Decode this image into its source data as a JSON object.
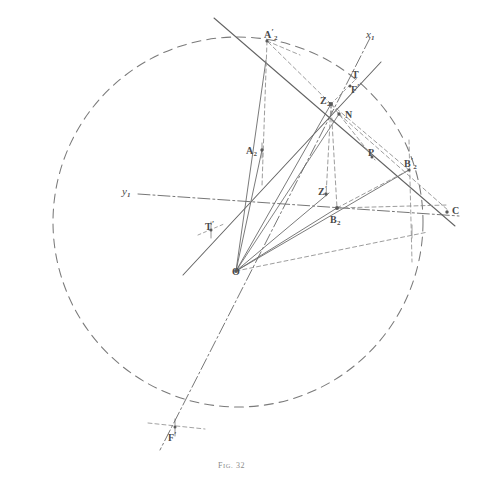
{
  "figure": {
    "caption_prefix": "F",
    "caption_small": "IG.",
    "caption_number": "32",
    "caption_full": "Fig. 32",
    "stroke_color": "#6b6b6b",
    "label_color": "#4a4a4a",
    "background": "#ffffff"
  },
  "labels": [
    {
      "id": "A2prime",
      "text": "A",
      "prime": "′",
      "sub": "2",
      "x": 264,
      "y": 29,
      "italic": false
    },
    {
      "id": "x1",
      "text": "x",
      "prime": "",
      "sub": "1",
      "x": 366,
      "y": 29,
      "italic": true
    },
    {
      "id": "T",
      "text": "T",
      "prime": "",
      "sub": "",
      "x": 352,
      "y": 70,
      "italic": false
    },
    {
      "id": "Fprime",
      "text": "F",
      "prime": "′",
      "sub": "",
      "x": 351,
      "y": 84,
      "italic": false
    },
    {
      "id": "Z2",
      "text": "Z",
      "prime": "",
      "sub": "2",
      "x": 320,
      "y": 96,
      "italic": false
    },
    {
      "id": "N",
      "text": "N",
      "prime": "",
      "sub": "",
      "x": 345,
      "y": 110,
      "italic": false
    },
    {
      "id": "A2",
      "text": "A",
      "prime": "",
      "sub": "2",
      "x": 246,
      "y": 146,
      "italic": false
    },
    {
      "id": "P",
      "text": "P",
      "prime": "",
      "sub": "",
      "x": 368,
      "y": 148,
      "italic": false
    },
    {
      "id": "B2prime",
      "text": "B",
      "prime": "′",
      "sub": "2",
      "x": 404,
      "y": 158,
      "italic": false
    },
    {
      "id": "y1",
      "text": "y",
      "prime": "",
      "sub": "1",
      "x": 122,
      "y": 186,
      "italic": true
    },
    {
      "id": "Zprime",
      "text": "Z",
      "prime": "′",
      "sub": "",
      "x": 318,
      "y": 186,
      "italic": false
    },
    {
      "id": "C",
      "text": "C",
      "prime": "",
      "sub": "",
      "x": 452,
      "y": 206,
      "italic": false
    },
    {
      "id": "Tprime",
      "text": "T",
      "prime": "′",
      "sub": "",
      "x": 205,
      "y": 221,
      "italic": false
    },
    {
      "id": "B2",
      "text": "B",
      "prime": "",
      "sub": "2",
      "x": 330,
      "y": 215,
      "italic": false
    },
    {
      "id": "O",
      "text": "O",
      "prime": "",
      "sub": "",
      "x": 232,
      "y": 267,
      "italic": false
    },
    {
      "id": "Fprime2",
      "text": "F",
      "prime": "′",
      "sub": "",
      "x": 168,
      "y": 432,
      "italic": false
    }
  ],
  "points": [
    {
      "id": "O",
      "x": 236,
      "y": 271
    },
    {
      "id": "Z2",
      "x": 331,
      "y": 104
    },
    {
      "id": "N",
      "x": 339,
      "y": 114
    },
    {
      "id": "A2",
      "x": 262,
      "y": 150
    },
    {
      "id": "A2prime",
      "x": 267,
      "y": 41
    },
    {
      "id": "B2",
      "x": 337,
      "y": 208
    },
    {
      "id": "B2prime",
      "x": 409,
      "y": 170
    },
    {
      "id": "Zprime",
      "x": 329,
      "y": 193
    },
    {
      "id": "P",
      "x": 372,
      "y": 157
    },
    {
      "id": "C",
      "x": 447,
      "y": 212
    },
    {
      "id": "T",
      "x": 350,
      "y": 83
    },
    {
      "id": "Tprime",
      "x": 211,
      "y": 230
    },
    {
      "id": "Fprime2",
      "x": 175,
      "y": 427
    },
    {
      "id": "Q",
      "x": 412,
      "y": 231
    }
  ],
  "circle": {
    "cx": 238,
    "cy": 222,
    "r": 185,
    "style": "dashed"
  },
  "geometry_note": {
    "axes": [
      "x1",
      "y1"
    ],
    "axis_style": "dash-dot",
    "construction_style": "short-dashed",
    "ray_style": "solid"
  }
}
